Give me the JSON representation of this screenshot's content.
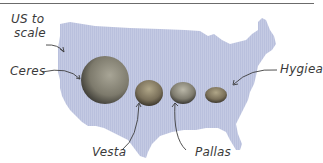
{
  "map": {
    "label_line1": "US to",
    "label_line2": "scale",
    "fill_color": "#c3c9e2"
  },
  "asteroids": [
    {
      "name": "Ceres"
    },
    {
      "name": "Vesta"
    },
    {
      "name": "Pallas"
    },
    {
      "name": "Hygiea"
    }
  ]
}
